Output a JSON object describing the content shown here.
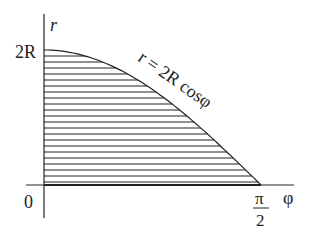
{
  "diagram": {
    "type": "polar-region-plot",
    "axes": {
      "vertical_label": "r",
      "horizontal_label": "φ",
      "origin_label": "0",
      "y_tick_label": "2R",
      "x_tick_numerator": "π",
      "x_tick_denominator": "2"
    },
    "curve": {
      "equation_label": "r = 2R cosφ",
      "function": "r = 2R cos(φ)",
      "domain": [
        0,
        1.5708
      ],
      "range": [
        0,
        2
      ]
    },
    "region": {
      "fill_style": "horizontal-hatching",
      "description": "Region under the curve r = 2R cosφ for φ from 0 to π/2"
    },
    "colors": {
      "line": "#222222",
      "background": "#ffffff"
    }
  }
}
